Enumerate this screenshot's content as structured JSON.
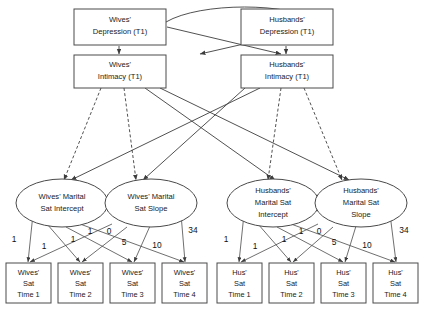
{
  "figure": {
    "type": "path-diagram"
  },
  "latent_t1": [
    {
      "id": "wives-depression",
      "line1": "Wives'",
      "line2": "Depression (T1)"
    },
    {
      "id": "husbands-depression",
      "line1": "Husbands'",
      "line2": "Depression (T1)"
    },
    {
      "id": "wives-intimacy",
      "line1": "Wives'",
      "line2": "Intimacy (T1)"
    },
    {
      "id": "husbands-intimacy",
      "line1": "Husbands'",
      "line2": "Intimacy (T1)"
    }
  ],
  "growth_factors": [
    {
      "id": "wives-intercept",
      "line1": "Wives' Marital",
      "line2": "Sat Intercept",
      "line3": ""
    },
    {
      "id": "wives-slope",
      "line1": "Wives' Marital",
      "line2": "Sat Slope",
      "line3": ""
    },
    {
      "id": "husbands-intercept",
      "line1": "Husbands'",
      "line2": "Marital Sat",
      "line3": "Intercept"
    },
    {
      "id": "husbands-slope",
      "line1": "Husbands'",
      "line2": "Marital Sat",
      "line3": "Slope"
    }
  ],
  "indicators": {
    "wives": [
      {
        "line1": "Wives'",
        "line2": "Sat",
        "line3": "Time 1"
      },
      {
        "line1": "Wives'",
        "line2": "Sat",
        "line3": "Time 2"
      },
      {
        "line1": "Wives'",
        "line2": "Sat",
        "line3": "Time 3"
      },
      {
        "line1": "Wives'",
        "line2": "Sat",
        "line3": "Time 4"
      }
    ],
    "husbands": [
      {
        "line1": "Hus'",
        "line2": "Sat",
        "line3": "Time 1"
      },
      {
        "line1": "Hus'",
        "line2": "Sat",
        "line3": "Time 2"
      },
      {
        "line1": "Hus'",
        "line2": "Sat",
        "line3": "Time 3"
      },
      {
        "line1": "Hus'",
        "line2": "Sat",
        "line3": "Time 4"
      }
    ]
  },
  "loadings": {
    "intercept": [
      "1",
      "1",
      "1",
      "1"
    ],
    "slope": [
      "0",
      "5",
      "10",
      "34"
    ]
  },
  "colors": {
    "background": "#ffffff",
    "stroke": "#4a4a4a",
    "text": "#1a1a1a"
  }
}
